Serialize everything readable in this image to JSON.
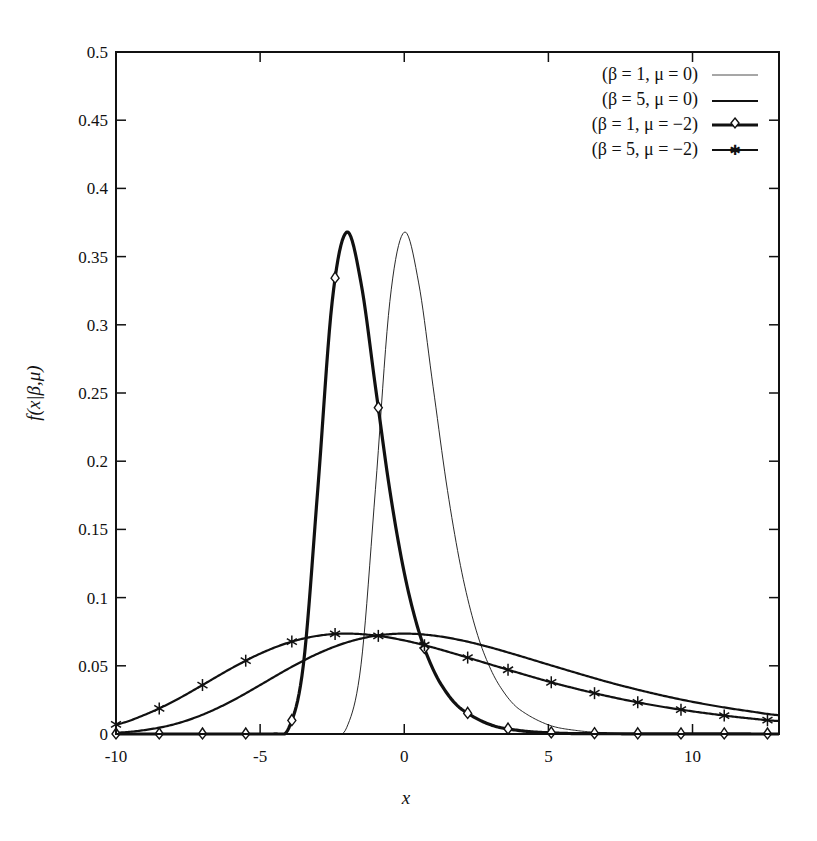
{
  "chart_data": {
    "type": "line",
    "title": "",
    "xlabel": "x",
    "ylabel": "f(x|β,μ)",
    "xlim": [
      -10,
      13
    ],
    "ylim": [
      0,
      0.5
    ],
    "grid": false,
    "legend_position": "upper right",
    "xticks": [
      -10,
      -5,
      0,
      5,
      10
    ],
    "xtick_labels": [
      "-10",
      "-5",
      "0",
      "5",
      "10"
    ],
    "yticks": [
      0,
      0.05,
      0.1,
      0.15,
      0.2,
      0.25,
      0.3,
      0.35,
      0.4,
      0.45,
      0.5
    ],
    "ytick_labels": [
      "0",
      "0.05",
      "0.1",
      "0.15",
      "0.2",
      "0.25",
      "0.3",
      "0.35",
      "0.4",
      "0.45",
      "0.5"
    ],
    "series": [
      {
        "name": "(β = 1, μ = 0)",
        "style": "thin",
        "marker": "none",
        "x": [
          -10,
          -3,
          -2.5,
          -2,
          -1.5,
          -1,
          -0.5,
          0,
          0.5,
          1,
          1.5,
          2,
          2.5,
          3,
          3.5,
          4,
          5,
          6,
          7,
          8,
          13
        ],
        "values": [
          0,
          0,
          0.0001,
          0.0046,
          0.0507,
          0.1794,
          0.3171,
          0.3679,
          0.3307,
          0.2546,
          0.1785,
          0.1182,
          0.0756,
          0.0474,
          0.0293,
          0.018,
          0.0067,
          0.0025,
          0.0009,
          0.0003,
          0
        ]
      },
      {
        "name": "(β = 5, μ = 0)",
        "style": "medium",
        "marker": "none",
        "x": [
          -10,
          -9,
          -8,
          -7,
          -6,
          -5,
          -4,
          -3,
          -2,
          -1,
          0,
          1,
          2,
          3,
          4,
          5,
          6,
          7,
          8,
          9,
          10,
          11,
          12,
          13
        ],
        "values": [
          0.0009,
          0.0029,
          0.007,
          0.0141,
          0.024,
          0.0359,
          0.0481,
          0.0589,
          0.0671,
          0.072,
          0.0736,
          0.0722,
          0.0686,
          0.0634,
          0.0573,
          0.0509,
          0.0446,
          0.0385,
          0.033,
          0.028,
          0.0236,
          0.0198,
          0.0166,
          0.0138
        ]
      },
      {
        "name": "(β = 1, μ = -2)",
        "style": "thick",
        "marker": "diamond",
        "x": [
          -10,
          -5,
          -4.5,
          -4,
          -3.5,
          -3,
          -2.5,
          -2,
          -1.5,
          -1,
          -0.5,
          0,
          0.5,
          1,
          1.5,
          2,
          3,
          4,
          5,
          6,
          13
        ],
        "values": [
          0,
          0,
          0.0001,
          0.0046,
          0.0507,
          0.1794,
          0.3171,
          0.3679,
          0.3307,
          0.2546,
          0.1785,
          0.1182,
          0.0756,
          0.0474,
          0.0293,
          0.018,
          0.0067,
          0.0025,
          0.0009,
          0.0003,
          0
        ],
        "marker_x": [
          -10,
          -8.5,
          -7.0,
          -5.5,
          -3.9,
          -2.4,
          -0.9,
          0.7,
          2.2,
          3.6,
          5.1,
          6.6,
          8.1,
          9.6,
          11.1,
          12.6
        ]
      },
      {
        "name": "(β = 5, μ = -2)",
        "style": "medium",
        "marker": "star",
        "x": [
          -10,
          -9,
          -8,
          -7,
          -6,
          -5,
          -4,
          -3,
          -2,
          -1,
          0,
          1,
          2,
          3,
          4,
          5,
          6,
          7,
          8,
          9,
          10,
          11,
          12,
          13
        ],
        "values": [
          0.007,
          0.0141,
          0.024,
          0.0359,
          0.0481,
          0.0589,
          0.0671,
          0.072,
          0.0736,
          0.0722,
          0.0686,
          0.0634,
          0.0573,
          0.0509,
          0.0446,
          0.0385,
          0.033,
          0.028,
          0.0236,
          0.0198,
          0.0166,
          0.0138,
          0.0114,
          0.0095
        ],
        "marker_x": [
          -10,
          -8.5,
          -7.0,
          -5.5,
          -3.9,
          -2.4,
          -0.9,
          0.7,
          2.2,
          3.6,
          5.1,
          6.6,
          8.1,
          9.6,
          11.1,
          12.6
        ]
      }
    ]
  },
  "legend": {
    "items": [
      {
        "label": "(β = 1, μ = 0)"
      },
      {
        "label": "(β = 5, μ = 0)"
      },
      {
        "label": "(β = 1, μ = −2)"
      },
      {
        "label": "(β = 5, μ = −2)"
      }
    ]
  },
  "axes": {
    "xlabel": "x",
    "ylabel": "f(x|β,μ)"
  }
}
